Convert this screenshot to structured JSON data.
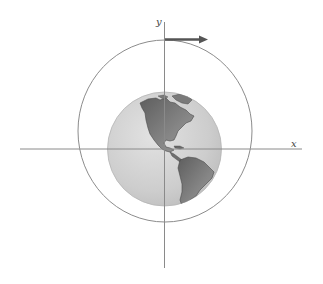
{
  "diagram": {
    "type": "orbit-diagram",
    "axes": {
      "x_label": "x",
      "y_label": "y"
    },
    "orbit": {
      "shape": "circle",
      "stroke": "#8c8c8c"
    },
    "planet": {
      "name": "Earth",
      "ocean_color": "#cfcfcf",
      "land_color": "#6f6f6f",
      "view": "Western Hemisphere (North and South America)"
    },
    "velocity_vector": {
      "direction": "positive-x",
      "color": "#555555"
    },
    "colors": {
      "axis": "#8a8a8a",
      "background": "#ffffff"
    }
  }
}
